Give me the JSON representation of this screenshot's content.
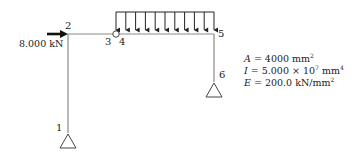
{
  "nodes": [
    {
      "id": "1",
      "x": 68,
      "y": 133
    },
    {
      "id": "2",
      "x": 68,
      "y": 34
    },
    {
      "id": "3",
      "x": 116,
      "y": 34
    },
    {
      "id": "4",
      "x": 116,
      "y": 34
    },
    {
      "id": "5",
      "x": 214,
      "y": 34
    },
    {
      "id": "6",
      "x": 214,
      "y": 82
    }
  ],
  "node_labels": {
    "n1": "1",
    "n2": "2",
    "n3": "3",
    "n4": "4",
    "n5": "5",
    "n6": "6"
  },
  "members": [
    {
      "from": "1",
      "to": "2"
    },
    {
      "from": "2",
      "to": "3"
    },
    {
      "from": "4",
      "to": "5"
    },
    {
      "from": "5",
      "to": "6"
    }
  ],
  "supports": [
    {
      "node": "1",
      "type": "pin"
    },
    {
      "node": "6",
      "type": "pin"
    }
  ],
  "hinge": {
    "between": [
      "3",
      "4"
    ]
  },
  "point_load": {
    "node": "2",
    "direction": "right",
    "label": "8.000 kN"
  },
  "distributed_load": {
    "from": "4",
    "to": "5",
    "direction": "down",
    "arrow_count": 11
  },
  "properties": {
    "A_sym": "A",
    "A_val": " = 4000 mm",
    "A_exp": "2",
    "I_sym": "I",
    "I_val": " = 5.000 × 10",
    "I_pow": "7",
    "I_unit": " mm",
    "I_exp": "4",
    "E_sym": "E",
    "E_val": " = 200.0 kN/mm",
    "E_exp": "2"
  },
  "colors": {
    "member": "#8a8a8a",
    "load": "#222222",
    "text": "#222222"
  }
}
